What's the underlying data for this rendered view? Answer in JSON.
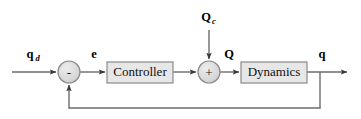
{
  "diagram": {
    "type": "control-system-block-diagram",
    "title": "",
    "colors": {
      "block_fill": "#e7e7e7",
      "block_stroke": "#8a8a8a",
      "junction_fill": "#d9d9d9",
      "junction_stroke": "#8a8a8a",
      "line": "#6b6b6b",
      "text": "#000000",
      "background": "#ffffff"
    },
    "blocks": [
      {
        "id": "controller",
        "label": "Controller",
        "x": 107,
        "y": 62,
        "width": 66,
        "height": 21
      },
      {
        "id": "dynamics",
        "label": "Dynamics",
        "x": 241,
        "y": 62,
        "width": 66,
        "height": 21
      }
    ],
    "junctions": [
      {
        "id": "error-sum",
        "sign": "-",
        "cx": 69,
        "cy": 72,
        "r": 11
      },
      {
        "id": "torque-sum",
        "sign": "+",
        "cx": 209,
        "cy": 72,
        "r": 11
      }
    ],
    "signals": [
      {
        "id": "reference",
        "symbol": "q",
        "subscript": "d",
        "x": 30,
        "y": 58
      },
      {
        "id": "error",
        "symbol": "e",
        "subscript": "",
        "x": 94,
        "y": 58
      },
      {
        "id": "disturbance",
        "symbol": "Q",
        "subscript": "c",
        "x": 209,
        "y": 21
      },
      {
        "id": "control-effort",
        "symbol": "Q",
        "subscript": "",
        "x": 229,
        "y": 58
      },
      {
        "id": "output",
        "symbol": "q",
        "subscript": "",
        "x": 322,
        "y": 58
      }
    ],
    "connections": [
      {
        "id": "reference-to-sum",
        "from": "input",
        "to": "error-sum"
      },
      {
        "id": "sum-to-controller",
        "from": "error-sum",
        "to": "controller"
      },
      {
        "id": "controller-to-sum2",
        "from": "controller",
        "to": "torque-sum"
      },
      {
        "id": "disturbance-to-sum2",
        "from": "disturbance",
        "to": "torque-sum"
      },
      {
        "id": "sum2-to-dynamics",
        "from": "torque-sum",
        "to": "dynamics"
      },
      {
        "id": "dynamics-to-output",
        "from": "dynamics",
        "to": "output"
      },
      {
        "id": "feedback-path",
        "from": "output",
        "to": "error-sum"
      }
    ]
  }
}
